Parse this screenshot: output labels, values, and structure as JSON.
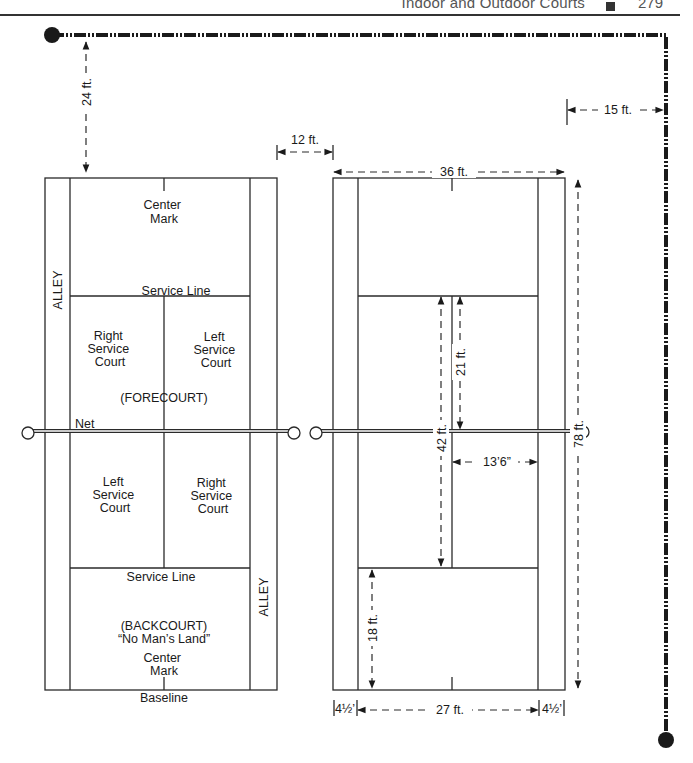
{
  "header": {
    "running_title": "Indoor and Outdoor Courts",
    "page_number": "279"
  },
  "left_court": {
    "labels": {
      "center_mark_top": [
        "Center",
        "Mark"
      ],
      "service_line_top": "Service Line",
      "alley_left": "ALLEY",
      "right_service_court_top": [
        "Right",
        "Service",
        "Court"
      ],
      "left_service_court_top": [
        "Left",
        "Service",
        "Court"
      ],
      "forecourt": "(FORECOURT)",
      "net": "Net",
      "left_service_court_bottom": [
        "Left",
        "Service",
        "Court"
      ],
      "right_service_court_bottom": [
        "Right",
        "Service",
        "Court"
      ],
      "service_line_bottom": "Service Line",
      "alley_right": "ALLEY",
      "backcourt": "(BACKCOURT)",
      "no_mans_land": "“No Man’s Land”",
      "center_mark_bottom": [
        "Center",
        "Mark"
      ],
      "baseline": "Baseline"
    }
  },
  "dimensions": {
    "back_clearance": "24 ft.",
    "between_courts": "12 ft.",
    "court_width": "36 ft.",
    "side_clearance": "15 ft.",
    "service_to_net": "21 ft.",
    "service_line_span": "42 ft.",
    "court_length": "78 ft.",
    "service_court_width": "13’6”",
    "backcourt_depth": "18 ft.",
    "alley_left": "4½’",
    "singles_width": "27 ft.",
    "alley_right": "4½’"
  }
}
